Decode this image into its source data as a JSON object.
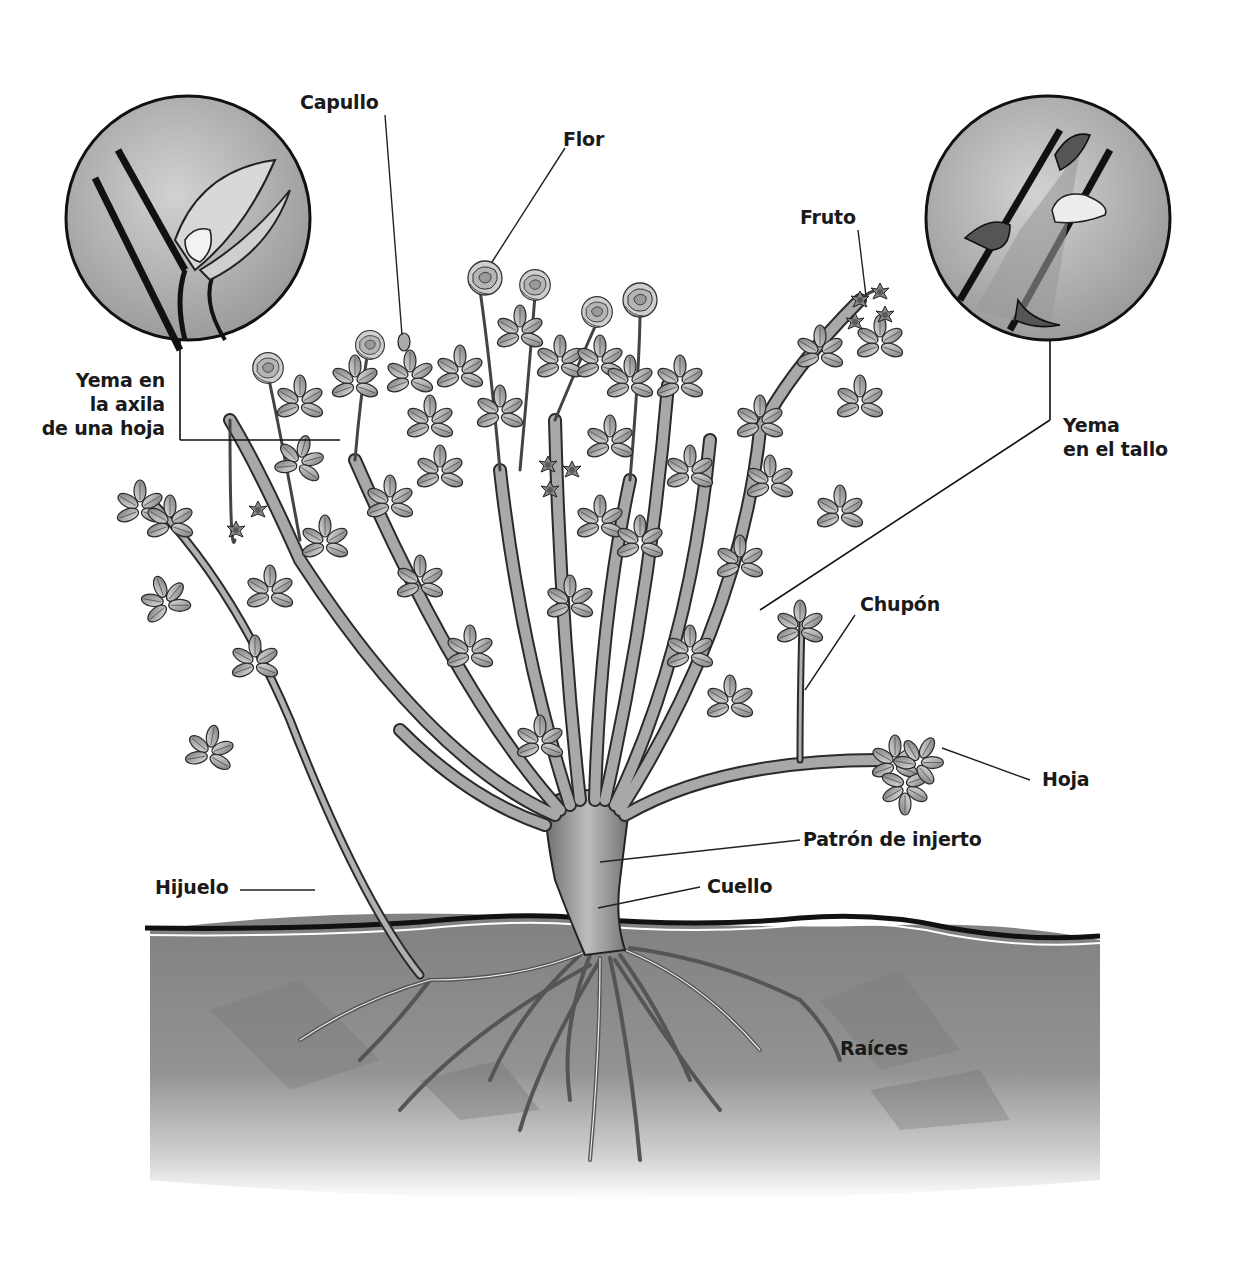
{
  "diagram": {
    "language": "es",
    "colors": {
      "background": "#ffffff",
      "ink": "#1a1a1a",
      "stem": "#8a8a8a",
      "leaf": "#9a9a9a",
      "soil": "#8c8c8c",
      "soil_dark": "#6e6e6e",
      "inset_bg": "#b5b5b5"
    },
    "labels": {
      "capullo": "Capullo",
      "flor": "Flor",
      "fruto": "Fruto",
      "yema_axila": {
        "line1": "Yema en",
        "line2": "la axila",
        "line3": "de una hoja"
      },
      "yema_tallo": {
        "line1": "Yema",
        "line2": "en el tallo"
      },
      "chupon": "Chupón",
      "hoja": "Hoja",
      "patron": "Patrón de injerto",
      "hijuelo": "Hijuelo",
      "cuello": "Cuello",
      "raices": "Raíces"
    },
    "insets": [
      {
        "name": "yema-axila-inset",
        "description": "Detalle de la yema en la axila de una hoja"
      },
      {
        "name": "yema-tallo-inset",
        "description": "Detalle de la yema en el tallo con espinas"
      }
    ]
  }
}
